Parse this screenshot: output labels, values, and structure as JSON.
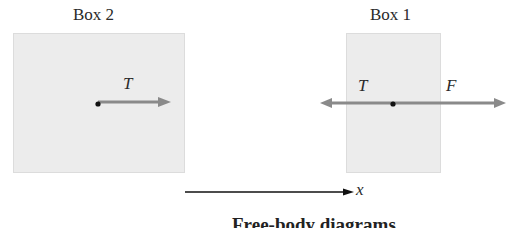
{
  "box2": {
    "title": "Box 2",
    "forces": [
      {
        "label": "T",
        "direction": "right"
      }
    ]
  },
  "box1": {
    "title": "Box 1",
    "forces": [
      {
        "label": "T",
        "direction": "left"
      },
      {
        "label": "F",
        "direction": "right"
      }
    ]
  },
  "axis": {
    "label": "x",
    "direction": "right"
  },
  "caption": "Free-body diagrams",
  "colors": {
    "box_fill": "#ececec",
    "force_arrow": "#8a8a8a",
    "axis_arrow": "#111111",
    "point": "#111111"
  }
}
